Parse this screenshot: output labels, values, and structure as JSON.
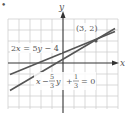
{
  "figure": {
    "bullet": "•",
    "axes": {
      "x_label": "x",
      "y_label": "y",
      "x_range": [
        -5,
        5
      ],
      "y_range": [
        -4,
        4.5
      ],
      "grid": true
    },
    "lines": [
      {
        "equation": "2x = 5y − 4",
        "label_parts": [
          "2",
          "x",
          " = 5",
          "y",
          " − 4"
        ]
      },
      {
        "equation": "x − (5/3)y + (1/3) = 0",
        "label_parts": {
          "x": "x",
          "minus": "−",
          "frac1_num": "5",
          "frac1_den": "3",
          "y": "y",
          "plus": "+",
          "frac2_num": "1",
          "frac2_den": "3",
          "eq": "= 0"
        }
      }
    ],
    "intersection": {
      "label": "(3, 2)",
      "x": 3,
      "y": 2
    },
    "colors": {
      "grid": "#c8c8c8",
      "axis": "#333333",
      "line": "#555555",
      "text": "#555555"
    }
  }
}
